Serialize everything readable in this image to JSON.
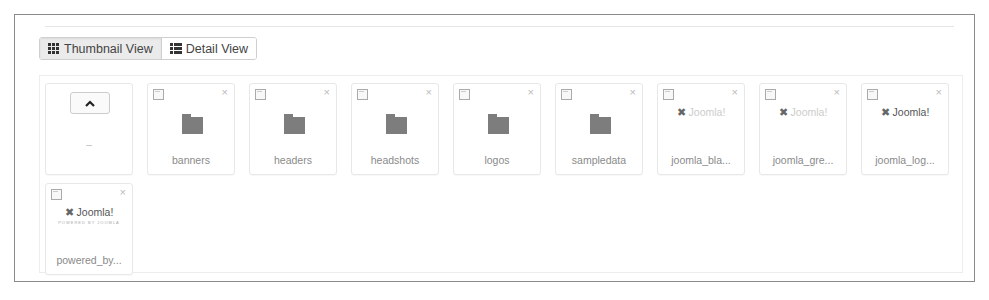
{
  "toolbar": {
    "views": [
      {
        "label": "Thumbnail View",
        "icon": "grid-icon",
        "active": true
      },
      {
        "label": "Detail View",
        "icon": "list-icon",
        "active": false
      }
    ]
  },
  "parent_tile": {
    "icon": "chevron-up-icon",
    "label": "..",
    "dash": "–"
  },
  "items": [
    {
      "type": "folder",
      "name": "banners"
    },
    {
      "type": "folder",
      "name": "headers"
    },
    {
      "type": "folder",
      "name": "headshots"
    },
    {
      "type": "folder",
      "name": "logos"
    },
    {
      "type": "folder",
      "name": "sampledata"
    },
    {
      "type": "image",
      "name": "joomla_bla...",
      "logo_text": "Joomla!",
      "faint": true
    },
    {
      "type": "image",
      "name": "joomla_gre...",
      "logo_text": "Joomla!",
      "faint": true
    },
    {
      "type": "image",
      "name": "joomla_log...",
      "logo_text": "Joomla!",
      "faint": false
    },
    {
      "type": "image",
      "name": "powered_by...",
      "logo_text": "Joomla!",
      "sub": "POWERED BY JOOMLA",
      "faint": false
    }
  ],
  "icons": {
    "checkbox": "checkbox-icon",
    "delete": "×",
    "logo_mark": "✖"
  }
}
